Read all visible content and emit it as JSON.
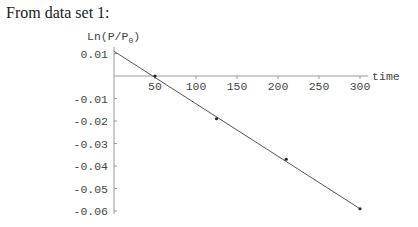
{
  "intro_text": "From data set 1:",
  "chart_data": {
    "type": "scatter",
    "title": "",
    "xlabel": "time",
    "ylabel": "Ln(P/P0)",
    "xlim": [
      0,
      310
    ],
    "ylim": [
      -0.06,
      0.012
    ],
    "x_ticks": [
      50,
      100,
      150,
      200,
      250,
      300
    ],
    "y_ticks": [
      0.01,
      -0.01,
      -0.02,
      -0.03,
      -0.04,
      -0.05,
      -0.06
    ],
    "grid": false,
    "series": [
      {
        "name": "data points",
        "x": [
          50,
          125,
          210,
          300
        ],
        "y": [
          0.0,
          -0.019,
          -0.037,
          -0.059
        ]
      },
      {
        "name": "fit line",
        "x": [
          0,
          300
        ],
        "y": [
          0.011,
          -0.059
        ]
      }
    ]
  }
}
